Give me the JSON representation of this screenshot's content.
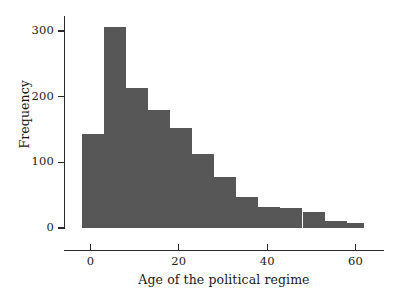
{
  "chart_data": {
    "type": "bar",
    "title": "",
    "subtitle": "",
    "xlabel": "Age of the political regime",
    "ylabel": "Frequency",
    "xlim": [
      -6,
      66
    ],
    "ylim": [
      0,
      320
    ],
    "grid": false,
    "legend": null,
    "bin_width": 5,
    "bar_color": "#575757",
    "axis_color": "#2a2a2a",
    "background_color": "#ffffff",
    "xticks": [
      {
        "value": 0,
        "label": "0"
      },
      {
        "value": 20,
        "label": "20"
      },
      {
        "value": 40,
        "label": "40"
      },
      {
        "value": 60,
        "label": "60"
      }
    ],
    "yticks": [
      {
        "value": 0,
        "label": "0"
      },
      {
        "value": 100,
        "label": "100"
      },
      {
        "value": 200,
        "label": "200"
      },
      {
        "value": 300,
        "label": "300"
      }
    ],
    "bins": [
      {
        "x0": -2,
        "x1": 3,
        "label": "-2 to 3",
        "value": 143
      },
      {
        "x0": 3,
        "x1": 8,
        "label": "3 to 8",
        "value": 307
      },
      {
        "x0": 8,
        "x1": 13,
        "label": "8 to 13",
        "value": 213
      },
      {
        "x0": 13,
        "x1": 18,
        "label": "13 to 18",
        "value": 180
      },
      {
        "x0": 18,
        "x1": 23,
        "label": "18 to 23",
        "value": 152
      },
      {
        "x0": 23,
        "x1": 28,
        "label": "23 to 28",
        "value": 113
      },
      {
        "x0": 28,
        "x1": 33,
        "label": "28 to 33",
        "value": 77
      },
      {
        "x0": 33,
        "x1": 38,
        "label": "33 to 38",
        "value": 48
      },
      {
        "x0": 38,
        "x1": 43,
        "label": "38 to 43",
        "value": 32
      },
      {
        "x0": 43,
        "x1": 48,
        "label": "43 to 48",
        "value": 30
      },
      {
        "x0": 48,
        "x1": 53,
        "label": "48 to 53",
        "value": 24
      },
      {
        "x0": 53,
        "x1": 58,
        "label": "53 to 58",
        "value": 11
      },
      {
        "x0": 58,
        "x1": 62,
        "label": "58 to 62",
        "value": 7
      }
    ],
    "categories": [
      "-2 to 3",
      "3 to 8",
      "8 to 13",
      "13 to 18",
      "18 to 23",
      "23 to 28",
      "28 to 33",
      "33 to 38",
      "38 to 43",
      "43 to 48",
      "48 to 53",
      "53 to 58",
      "58 to 62"
    ],
    "values": [
      143,
      307,
      213,
      180,
      152,
      113,
      77,
      48,
      32,
      30,
      24,
      11,
      7
    ]
  }
}
